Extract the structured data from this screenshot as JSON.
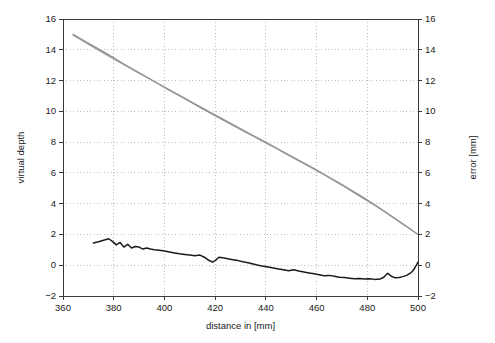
{
  "chart_data": {
    "type": "line",
    "title": "",
    "xlabel": "distance in [mm]",
    "ylabel": "virtual depth",
    "y2label": "error [mm]",
    "xlim": [
      360,
      500
    ],
    "ylim": [
      -2,
      16
    ],
    "y2lim": [
      -2,
      16
    ],
    "xticks": [
      360,
      380,
      400,
      420,
      440,
      460,
      480,
      500
    ],
    "yticks": [
      -2,
      0,
      2,
      4,
      6,
      8,
      10,
      12,
      14,
      16
    ],
    "y2ticks": [
      -2,
      0,
      2,
      4,
      6,
      8,
      10,
      12,
      14,
      16
    ],
    "grid": true,
    "grid_style": "dotted",
    "grid_color": "#b0b0b0",
    "legend": "none",
    "series": [
      {
        "name": "virtual depth (measured)",
        "axis": "left",
        "color": "#8c8c8c",
        "width": 1.3,
        "x": [
          364,
          368,
          372,
          376,
          380,
          384,
          388,
          392,
          396,
          400,
          404,
          408,
          412,
          416,
          420,
          424,
          428,
          432,
          436,
          440,
          444,
          448,
          452,
          456,
          460,
          464,
          468,
          472,
          476,
          480,
          484,
          488,
          492,
          496,
          500
        ],
        "y": [
          15.0,
          14.62,
          14.24,
          13.86,
          13.48,
          13.08,
          12.7,
          12.32,
          11.94,
          11.56,
          11.18,
          10.82,
          10.45,
          10.08,
          9.72,
          9.36,
          9.0,
          8.64,
          8.3,
          7.95,
          7.6,
          7.24,
          6.88,
          6.52,
          6.16,
          5.78,
          5.4,
          5.0,
          4.6,
          4.2,
          3.78,
          3.35,
          2.9,
          2.45,
          2.0
        ]
      },
      {
        "name": "virtual depth (reference)",
        "axis": "left",
        "color": "#9a9a9a",
        "width": 1.1,
        "x": [
          364,
          368,
          372,
          376,
          380,
          384,
          388,
          392,
          396,
          400,
          404,
          408,
          412,
          416,
          420,
          424,
          428,
          432,
          436,
          440,
          444,
          448,
          452,
          456,
          460,
          464,
          468,
          472,
          476,
          480,
          484,
          488,
          492,
          496,
          500
        ],
        "y": [
          14.95,
          14.56,
          14.17,
          13.78,
          13.4,
          13.02,
          12.66,
          12.3,
          11.94,
          11.58,
          11.22,
          10.86,
          10.5,
          10.14,
          9.78,
          9.42,
          9.06,
          8.7,
          8.35,
          8.0,
          7.64,
          7.28,
          6.92,
          6.56,
          6.2,
          5.82,
          5.44,
          5.06,
          4.66,
          4.25,
          3.82,
          3.38,
          2.93,
          2.47,
          2.0
        ]
      },
      {
        "name": "error",
        "axis": "right",
        "color": "#1a1a1a",
        "width": 1.5,
        "x": [
          372.0,
          374.0,
          376.0,
          378.0,
          379.5,
          381.0,
          382.5,
          384.0,
          385.5,
          387.0,
          388.5,
          390.0,
          391.5,
          393.0,
          394.5,
          396.0,
          398.0,
          400.0,
          402.0,
          404.0,
          406.0,
          408.0,
          410.0,
          412.0,
          414.0,
          416.0,
          417.5,
          419.0,
          420.0,
          421.5,
          423.0,
          425.0,
          427.0,
          429.0,
          431.0,
          433.0,
          435.0,
          437.0,
          439.0,
          441.0,
          443.0,
          445.0,
          447.0,
          449.0,
          451.0,
          453.0,
          455.0,
          457.0,
          459.0,
          461.0,
          463.0,
          465.0,
          467.0,
          469.0,
          471.0,
          473.0,
          475.0,
          477.0,
          479.0,
          481.0,
          483.0,
          485.0,
          486.5,
          488.0,
          489.5,
          491.0,
          492.5,
          494.0,
          495.5,
          497.0,
          498.0,
          499.0,
          500.0
        ],
        "y": [
          1.45,
          1.52,
          1.62,
          1.72,
          1.55,
          1.32,
          1.48,
          1.18,
          1.36,
          1.12,
          1.22,
          1.18,
          1.05,
          1.12,
          1.05,
          1.0,
          0.98,
          0.92,
          0.86,
          0.8,
          0.74,
          0.7,
          0.66,
          0.62,
          0.66,
          0.5,
          0.32,
          0.2,
          0.3,
          0.52,
          0.48,
          0.42,
          0.36,
          0.3,
          0.22,
          0.16,
          0.08,
          0.0,
          -0.06,
          -0.12,
          -0.18,
          -0.24,
          -0.3,
          -0.36,
          -0.3,
          -0.38,
          -0.44,
          -0.5,
          -0.56,
          -0.62,
          -0.68,
          -0.66,
          -0.72,
          -0.78,
          -0.8,
          -0.84,
          -0.88,
          -0.86,
          -0.9,
          -0.88,
          -0.92,
          -0.9,
          -0.78,
          -0.52,
          -0.72,
          -0.82,
          -0.8,
          -0.74,
          -0.66,
          -0.52,
          -0.36,
          -0.1,
          0.2
        ]
      }
    ]
  }
}
